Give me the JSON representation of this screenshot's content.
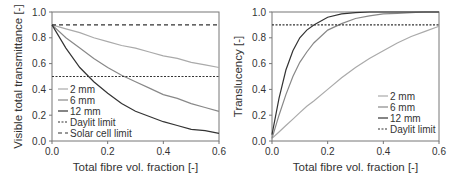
{
  "chart_data": [
    {
      "type": "line",
      "title": "",
      "xlabel": "Total fibre vol. fraction [-]",
      "ylabel": "Visible total transmittance [-]",
      "xlim": [
        0,
        0.6
      ],
      "ylim": [
        0,
        1.0
      ],
      "xticks": [
        "0.0",
        "0.2",
        "0.4",
        "0.6"
      ],
      "yticks": [
        "0.0",
        "0.2",
        "0.4",
        "0.6",
        "0.8",
        "1.0"
      ],
      "grid": false,
      "legend_position": "lower left",
      "x": [
        0,
        0.05,
        0.1,
        0.15,
        0.2,
        0.25,
        0.3,
        0.35,
        0.4,
        0.45,
        0.5,
        0.55,
        0.6
      ],
      "series": [
        {
          "name": "2 mm",
          "color": "#aaaaaa",
          "style": "solid",
          "values": [
            0.9,
            0.87,
            0.84,
            0.8,
            0.77,
            0.74,
            0.72,
            0.69,
            0.66,
            0.64,
            0.61,
            0.59,
            0.57
          ]
        },
        {
          "name": "6 mm",
          "color": "#888888",
          "style": "solid",
          "values": [
            0.9,
            0.8,
            0.72,
            0.64,
            0.57,
            0.51,
            0.46,
            0.41,
            0.36,
            0.33,
            0.29,
            0.26,
            0.23
          ]
        },
        {
          "name": "12 mm",
          "color": "#333333",
          "style": "solid",
          "values": [
            0.9,
            0.72,
            0.57,
            0.46,
            0.37,
            0.29,
            0.23,
            0.19,
            0.15,
            0.12,
            0.09,
            0.08,
            0.06
          ]
        },
        {
          "name": "Daylit limit",
          "color": "#333333",
          "style": "dotted",
          "values": [
            0.5,
            0.5,
            0.5,
            0.5,
            0.5,
            0.5,
            0.5,
            0.5,
            0.5,
            0.5,
            0.5,
            0.5,
            0.5
          ]
        },
        {
          "name": "Solar cell limit",
          "color": "#333333",
          "style": "dashed",
          "values": [
            0.9,
            0.9,
            0.9,
            0.9,
            0.9,
            0.9,
            0.9,
            0.9,
            0.9,
            0.9,
            0.9,
            0.9,
            0.9
          ]
        }
      ]
    },
    {
      "type": "line",
      "title": "",
      "xlabel": "Total fibre vol. fraction [-]",
      "ylabel": "Translucency [-]",
      "xlim": [
        0,
        0.6
      ],
      "ylim": [
        0,
        1.0
      ],
      "xticks": [
        "0.0",
        "0.2",
        "0.4",
        "0.6"
      ],
      "yticks": [
        "0.0",
        "0.2",
        "0.4",
        "0.6",
        "0.8",
        "1.0"
      ],
      "grid": false,
      "legend_position": "lower right",
      "x": [
        0,
        0.025,
        0.05,
        0.075,
        0.1,
        0.125,
        0.15,
        0.2,
        0.25,
        0.3,
        0.35,
        0.4,
        0.45,
        0.5,
        0.55,
        0.6
      ],
      "series": [
        {
          "name": "2 mm",
          "color": "#aaaaaa",
          "style": "solid",
          "values": [
            0.02,
            0.07,
            0.12,
            0.17,
            0.22,
            0.27,
            0.31,
            0.4,
            0.49,
            0.57,
            0.64,
            0.7,
            0.76,
            0.81,
            0.85,
            0.89
          ]
        },
        {
          "name": "6 mm",
          "color": "#888888",
          "style": "solid",
          "values": [
            0.02,
            0.2,
            0.36,
            0.5,
            0.61,
            0.69,
            0.76,
            0.86,
            0.91,
            0.95,
            0.97,
            0.985,
            0.99,
            0.995,
            1.0,
            1.0
          ]
        },
        {
          "name": "12 mm",
          "color": "#333333",
          "style": "solid",
          "values": [
            0.05,
            0.33,
            0.55,
            0.7,
            0.8,
            0.86,
            0.9,
            0.96,
            0.985,
            0.995,
            1.0,
            1.0,
            1.0,
            1.0,
            1.0,
            1.0
          ]
        },
        {
          "name": "Daylit limit",
          "color": "#333333",
          "style": "dotted",
          "values": [
            0.9,
            0.9,
            0.9,
            0.9,
            0.9,
            0.9,
            0.9,
            0.9,
            0.9,
            0.9,
            0.9,
            0.9,
            0.9,
            0.9,
            0.9,
            0.9
          ]
        }
      ]
    }
  ]
}
